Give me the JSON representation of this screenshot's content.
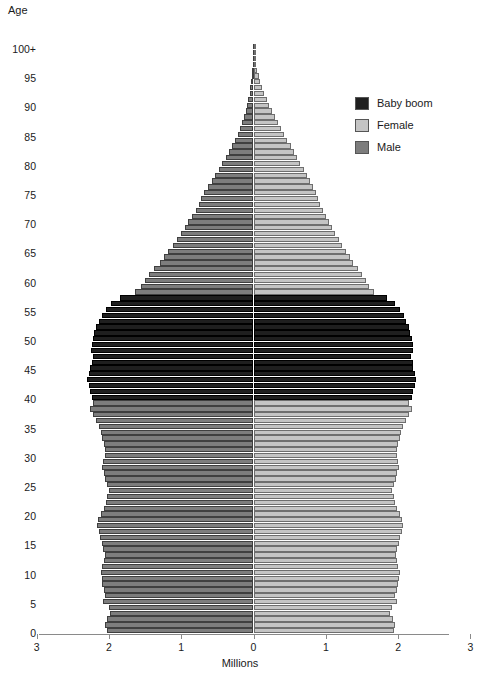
{
  "axes": {
    "y_title": "Age",
    "x_title": "Millions",
    "y_ticks": [
      "100+",
      "95",
      "90",
      "85",
      "80",
      "75",
      "70",
      "65",
      "60",
      "55",
      "50",
      "45",
      "40",
      "35",
      "30",
      "25",
      "20",
      "15",
      "10",
      "5",
      "0"
    ],
    "x_ticks": [
      "3",
      "2",
      "1",
      "0",
      "1",
      "2",
      "3"
    ]
  },
  "legend": {
    "items": [
      {
        "label": "Baby boom",
        "color": "#1f1f1f"
      },
      {
        "label": "Female",
        "color": "#c4c4c4"
      },
      {
        "label": "Male",
        "color": "#7d7d7d"
      }
    ]
  },
  "chart_data": {
    "type": "bar",
    "subtype": "population-pyramid",
    "title": "",
    "xlabel": "Millions",
    "ylabel": "Age",
    "xlim": [
      -3,
      3
    ],
    "ylim": [
      0,
      100
    ],
    "grid": false,
    "legend_position": "top-right",
    "x_tick_values": [
      3,
      2,
      1,
      0,
      1,
      2,
      3
    ],
    "y_tick_values": [
      100,
      95,
      90,
      85,
      80,
      75,
      70,
      65,
      60,
      55,
      50,
      45,
      40,
      35,
      30,
      25,
      20,
      15,
      10,
      5,
      0
    ],
    "baby_boom_age_range": [
      40,
      57
    ],
    "colors": {
      "male": "#7d7d7d",
      "female": "#c4c4c4",
      "baby_boom": "#1f1f1f"
    },
    "units": "millions of people",
    "categories": [
      0,
      1,
      2,
      3,
      4,
      5,
      6,
      7,
      8,
      9,
      10,
      11,
      12,
      13,
      14,
      15,
      16,
      17,
      18,
      19,
      20,
      21,
      22,
      23,
      24,
      25,
      26,
      27,
      28,
      29,
      30,
      31,
      32,
      33,
      34,
      35,
      36,
      37,
      38,
      39,
      40,
      41,
      42,
      43,
      44,
      45,
      46,
      47,
      48,
      49,
      50,
      51,
      52,
      53,
      54,
      55,
      56,
      57,
      58,
      59,
      60,
      61,
      62,
      63,
      64,
      65,
      66,
      67,
      68,
      69,
      70,
      71,
      72,
      73,
      74,
      75,
      76,
      77,
      78,
      79,
      80,
      81,
      82,
      83,
      84,
      85,
      86,
      87,
      88,
      89,
      90,
      91,
      92,
      93,
      94,
      95,
      96,
      97,
      98,
      99,
      100
    ],
    "series": [
      {
        "name": "Male",
        "side": "left",
        "values": [
          2.03,
          2.05,
          2.02,
          1.98,
          2.0,
          2.08,
          2.05,
          2.07,
          2.09,
          2.1,
          2.11,
          2.09,
          2.07,
          2.06,
          2.08,
          2.1,
          2.12,
          2.14,
          2.16,
          2.15,
          2.11,
          2.07,
          2.04,
          2.02,
          2.0,
          2.02,
          2.05,
          2.07,
          2.09,
          2.08,
          2.06,
          2.05,
          2.07,
          2.09,
          2.11,
          2.14,
          2.18,
          2.22,
          2.26,
          2.22,
          2.24,
          2.26,
          2.28,
          2.3,
          2.28,
          2.26,
          2.24,
          2.22,
          2.25,
          2.24,
          2.22,
          2.2,
          2.18,
          2.14,
          2.1,
          2.04,
          1.97,
          1.84,
          1.64,
          1.56,
          1.5,
          1.44,
          1.37,
          1.3,
          1.24,
          1.18,
          1.12,
          1.06,
          1.0,
          0.95,
          0.9,
          0.85,
          0.8,
          0.76,
          0.72,
          0.68,
          0.63,
          0.58,
          0.53,
          0.48,
          0.43,
          0.38,
          0.34,
          0.3,
          0.26,
          0.22,
          0.19,
          0.16,
          0.13,
          0.11,
          0.09,
          0.07,
          0.055,
          0.043,
          0.033,
          0.025,
          0.018,
          0.013,
          0.009,
          0.006,
          0.01
        ]
      },
      {
        "name": "Female",
        "side": "right",
        "values": [
          1.94,
          1.96,
          1.93,
          1.89,
          1.91,
          1.99,
          1.96,
          1.98,
          2.0,
          2.01,
          2.02,
          2.0,
          1.98,
          1.97,
          1.99,
          2.01,
          2.03,
          2.05,
          2.07,
          2.06,
          2.03,
          1.99,
          1.96,
          1.94,
          1.92,
          1.94,
          1.97,
          1.99,
          2.01,
          2.0,
          1.99,
          1.98,
          2.0,
          2.02,
          2.04,
          2.07,
          2.11,
          2.15,
          2.19,
          2.15,
          2.19,
          2.21,
          2.23,
          2.25,
          2.23,
          2.21,
          2.2,
          2.18,
          2.21,
          2.2,
          2.19,
          2.17,
          2.15,
          2.11,
          2.08,
          2.02,
          1.96,
          1.85,
          1.67,
          1.6,
          1.55,
          1.5,
          1.44,
          1.38,
          1.33,
          1.28,
          1.23,
          1.18,
          1.13,
          1.08,
          1.04,
          1.0,
          0.96,
          0.92,
          0.89,
          0.86,
          0.82,
          0.78,
          0.74,
          0.7,
          0.65,
          0.6,
          0.56,
          0.52,
          0.47,
          0.42,
          0.38,
          0.34,
          0.3,
          0.26,
          0.22,
          0.18,
          0.15,
          0.12,
          0.095,
          0.072,
          0.054,
          0.039,
          0.028,
          0.019,
          0.03
        ]
      }
    ]
  }
}
